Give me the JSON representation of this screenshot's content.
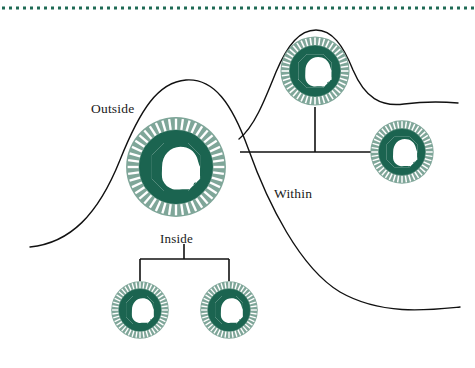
{
  "figure": {
    "background_color": "#ffffff",
    "width": 475,
    "height": 368
  },
  "labels": {
    "outside": "Outside",
    "within": "Within",
    "inside": "Inside"
  },
  "colors": {
    "dotted_rule": "#1f6b55",
    "ring_dark_green": "#1b6450",
    "ring_light_green": "#7fa699",
    "ring_tick": "#ffffff",
    "head_fill": "#ffffff",
    "curve_stroke": "#111111",
    "connector_stroke": "#111111",
    "label_text": "#1a1a1a"
  },
  "dotted_rule": {
    "name": "top-dotted-rule",
    "y": 8,
    "x_start": 2,
    "x_end": 473,
    "dot_size": 3,
    "dot_gap": 4,
    "dot_count": 68
  },
  "curves": [
    {
      "name": "large-bell-curve",
      "path": "M 30 247 C 70 243 98 215 120 160 C 140 110 158 82 186 80 C 214 78 232 104 248 148 C 268 204 300 268 340 292 C 382 316 430 310 460 307",
      "stroke": "#111111",
      "stroke_width": 1.4
    },
    {
      "name": "small-bell-curve",
      "path": "M 239 139 C 254 127 264 102 276 72 C 288 44 300 30 316 30 C 332 30 343 45 353 70 C 365 98 381 107 404 104 C 428 101 446 102 458 103",
      "stroke": "#111111",
      "stroke_width": 1.4
    }
  ],
  "connectors": {
    "within_bracket": {
      "name": "within-connector-bracket",
      "horizontal": {
        "y": 152,
        "x_start": 240,
        "x_end": 372
      },
      "vertical_to_top_node": {
        "x": 315,
        "y_start": 107,
        "y_end": 152
      }
    },
    "inside_bracket": {
      "name": "inside-connector-bracket",
      "horizontal": {
        "y": 259,
        "x_start": 140,
        "x_end": 229
      },
      "stem_up": {
        "x": 184,
        "y_start": 244,
        "y_end": 259
      },
      "stem_left": {
        "x": 140,
        "y_start": 259,
        "y_end": 281
      },
      "stem_right": {
        "x": 229,
        "y_start": 259,
        "y_end": 281
      }
    }
  },
  "nodes": [
    {
      "name": "head-node-outside",
      "role": "outside",
      "cx": 176,
      "cy": 167,
      "r": 52,
      "label": "Outside"
    },
    {
      "name": "head-node-within-top",
      "role": "within",
      "cx": 315,
      "cy": 71,
      "r": 36,
      "label": ""
    },
    {
      "name": "head-node-within-right",
      "role": "within",
      "cx": 402,
      "cy": 152,
      "r": 33,
      "label": ""
    },
    {
      "name": "head-node-inside-left",
      "role": "inside",
      "cx": 140,
      "cy": 310,
      "r": 30,
      "label": ""
    },
    {
      "name": "head-node-inside-right",
      "role": "inside",
      "cx": 229,
      "cy": 310,
      "r": 30,
      "label": ""
    }
  ],
  "node_design": {
    "description": "green annulus with radial white tick marks and a white right-facing human head profile inside an octagonal aperture",
    "tick_count": 44,
    "head_direction": "right"
  }
}
